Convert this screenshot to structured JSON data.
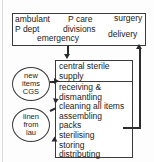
{
  "diagram": {
    "type": "flowchart",
    "departments_box": {
      "name": "hospital-departments",
      "labels": [
        {
          "id": "ambulant",
          "text": "ambulant"
        },
        {
          "id": "p-dept",
          "text": "P dept"
        },
        {
          "id": "p-care",
          "text": "P care"
        },
        {
          "id": "divisions",
          "text": "divisions"
        },
        {
          "id": "emergency",
          "text": "emergency"
        },
        {
          "id": "surgery",
          "text": "surgery"
        },
        {
          "id": "delivery",
          "text": "delivery"
        }
      ]
    },
    "process_box": {
      "name": "central-sterile-supply",
      "header_lines": [
        "central sterile",
        "supply"
      ],
      "steps": [
        "receiving &",
        "dismantling",
        "cleaning all items",
        "assembling",
        "packs",
        "sterilising",
        "storing",
        "distributing"
      ]
    },
    "inputs": [
      {
        "id": "new-items-cgs",
        "lines": [
          "new",
          "items",
          "CGS"
        ]
      },
      {
        "id": "linen-from-lau",
        "lines": [
          "linen",
          "from",
          "lau"
        ]
      }
    ],
    "connectors": [
      {
        "id": "departments-to-supply",
        "direction": "down"
      },
      {
        "id": "new-items-to-supply",
        "direction": "right"
      },
      {
        "id": "linen-to-supply",
        "direction": "right-up"
      },
      {
        "id": "supply-to-departments-return",
        "direction": "up"
      }
    ],
    "colors": {
      "stroke": "#3a3a3a",
      "arrow": "#2b2b2b",
      "text": "#1b1b1b",
      "background": "#fdfdfd"
    }
  }
}
